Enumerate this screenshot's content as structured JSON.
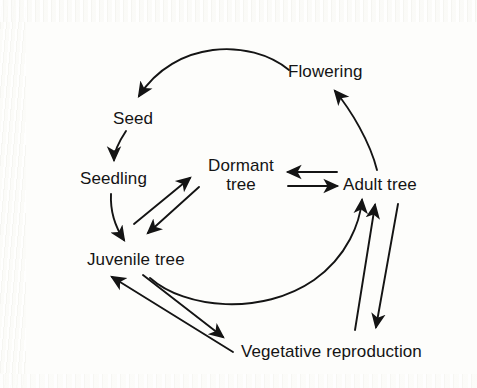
{
  "figure": {
    "kind": "life-cycle-diagram",
    "background_color": "#fdfdfb",
    "ink_color": "#141414"
  },
  "nodes": [
    {
      "id": "seed",
      "label": "Seed"
    },
    {
      "id": "seedling",
      "label": "Seedling"
    },
    {
      "id": "juvenile_tree",
      "label": "Juvenile tree"
    },
    {
      "id": "dormant_tree",
      "label_line1": "Dormant",
      "label_line2": "tree",
      "label": "Dormant tree"
    },
    {
      "id": "adult_tree",
      "label": "Adult tree"
    },
    {
      "id": "flowering",
      "label": "Flowering"
    },
    {
      "id": "vegetative_reproduction",
      "label": "Vegetative reproduction"
    }
  ],
  "edges": [
    {
      "from": "flowering",
      "to": "seed",
      "style": "curved",
      "direction": "one-way"
    },
    {
      "from": "seed",
      "to": "seedling",
      "style": "curved",
      "direction": "one-way"
    },
    {
      "from": "seedling",
      "to": "juvenile_tree",
      "style": "curved",
      "direction": "one-way"
    },
    {
      "from": "juvenile_tree",
      "to": "adult_tree",
      "style": "curved",
      "direction": "one-way"
    },
    {
      "from": "adult_tree",
      "to": "flowering",
      "style": "curved",
      "direction": "one-way"
    },
    {
      "from": "juvenile_tree",
      "to": "dormant_tree",
      "style": "straight",
      "direction": "one-way"
    },
    {
      "from": "dormant_tree",
      "to": "juvenile_tree",
      "style": "straight",
      "direction": "one-way"
    },
    {
      "from": "adult_tree",
      "to": "dormant_tree",
      "style": "straight",
      "direction": "one-way"
    },
    {
      "from": "dormant_tree",
      "to": "adult_tree",
      "style": "straight",
      "direction": "one-way"
    },
    {
      "from": "juvenile_tree",
      "to": "vegetative_reproduction",
      "style": "straight",
      "direction": "one-way"
    },
    {
      "from": "vegetative_reproduction",
      "to": "juvenile_tree",
      "style": "straight",
      "direction": "one-way"
    },
    {
      "from": "adult_tree",
      "to": "vegetative_reproduction",
      "style": "straight",
      "direction": "one-way"
    },
    {
      "from": "vegetative_reproduction",
      "to": "adult_tree",
      "style": "straight",
      "direction": "one-way"
    }
  ]
}
